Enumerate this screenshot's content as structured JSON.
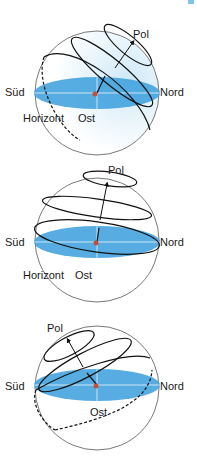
{
  "colors": {
    "horizon_fill": "#3a9fdc",
    "sphere_tint": "#d8eef9",
    "sphere_stroke": "#555555",
    "path_stroke": "#111111",
    "center_dot": "#c0503a",
    "corner_mark": "#7fc3e8"
  },
  "diagrams": [
    {
      "id": "mid-latitude",
      "labels": {
        "pol": "Pol",
        "sued": "Süd",
        "nord": "Nord",
        "horizont": "Horizont",
        "ost": "Ost"
      }
    },
    {
      "id": "high-latitude",
      "labels": {
        "pol": "Pol",
        "sued": "Süd",
        "nord": "Nord",
        "horizont": "Horizont",
        "ost": "Ost"
      }
    },
    {
      "id": "southern-hemisphere",
      "labels": {
        "pol": "Pol",
        "sued": "Süd",
        "nord": "Nord",
        "ost": "Ost"
      }
    }
  ]
}
